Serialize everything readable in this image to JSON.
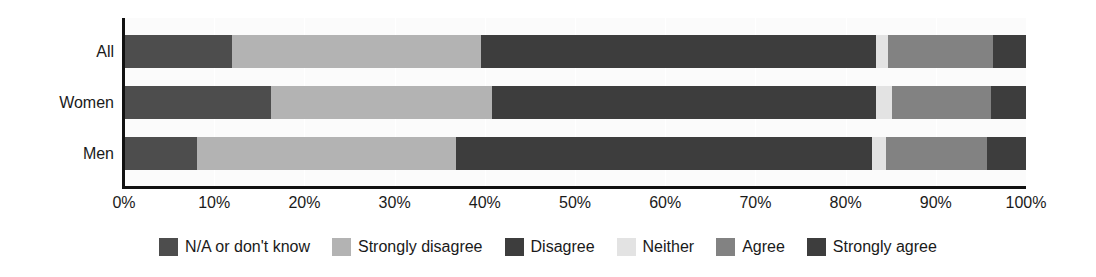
{
  "chart_data": {
    "type": "bar",
    "orientation": "horizontal",
    "stacked": true,
    "stack_mode": "percent",
    "title": "",
    "subtitle": "",
    "xlabel": "",
    "ylabel": "",
    "xlim": [
      0,
      100
    ],
    "xtick_labels": [
      "0%",
      "10%",
      "20%",
      "30%",
      "40%",
      "50%",
      "60%",
      "70%",
      "80%",
      "90%",
      "100%"
    ],
    "xtick_values": [
      0,
      10,
      20,
      30,
      40,
      50,
      60,
      70,
      80,
      90,
      100
    ],
    "grid": true,
    "grid_axis": "x",
    "legend_position": "bottom",
    "categories": [
      "All",
      "Women",
      "Men"
    ],
    "series": [
      {
        "name": "N/A or don't know",
        "color": "#4d4d4d",
        "values": [
          12.0,
          16.3,
          8.1
        ]
      },
      {
        "name": "Strongly disagree",
        "color": "#b3b3b3",
        "values": [
          27.6,
          24.5,
          28.7
        ]
      },
      {
        "name": "Disagree",
        "color": "#3d3d3d",
        "values": [
          43.8,
          42.6,
          46.1
        ]
      },
      {
        "name": "Neither",
        "color": "#e3e3e3",
        "values": [
          1.3,
          1.7,
          1.6
        ]
      },
      {
        "name": "Agree",
        "color": "#828282",
        "values": [
          11.6,
          11.0,
          11.2
        ]
      },
      {
        "name": "Strongly agree",
        "color": "#3d3d3d",
        "values": [
          3.7,
          3.9,
          4.3
        ]
      }
    ]
  },
  "colors": {
    "axis": "#111111",
    "plot_background": "#fbfbfb",
    "gridline": "#ffffff",
    "text": "#1a1a1a"
  }
}
